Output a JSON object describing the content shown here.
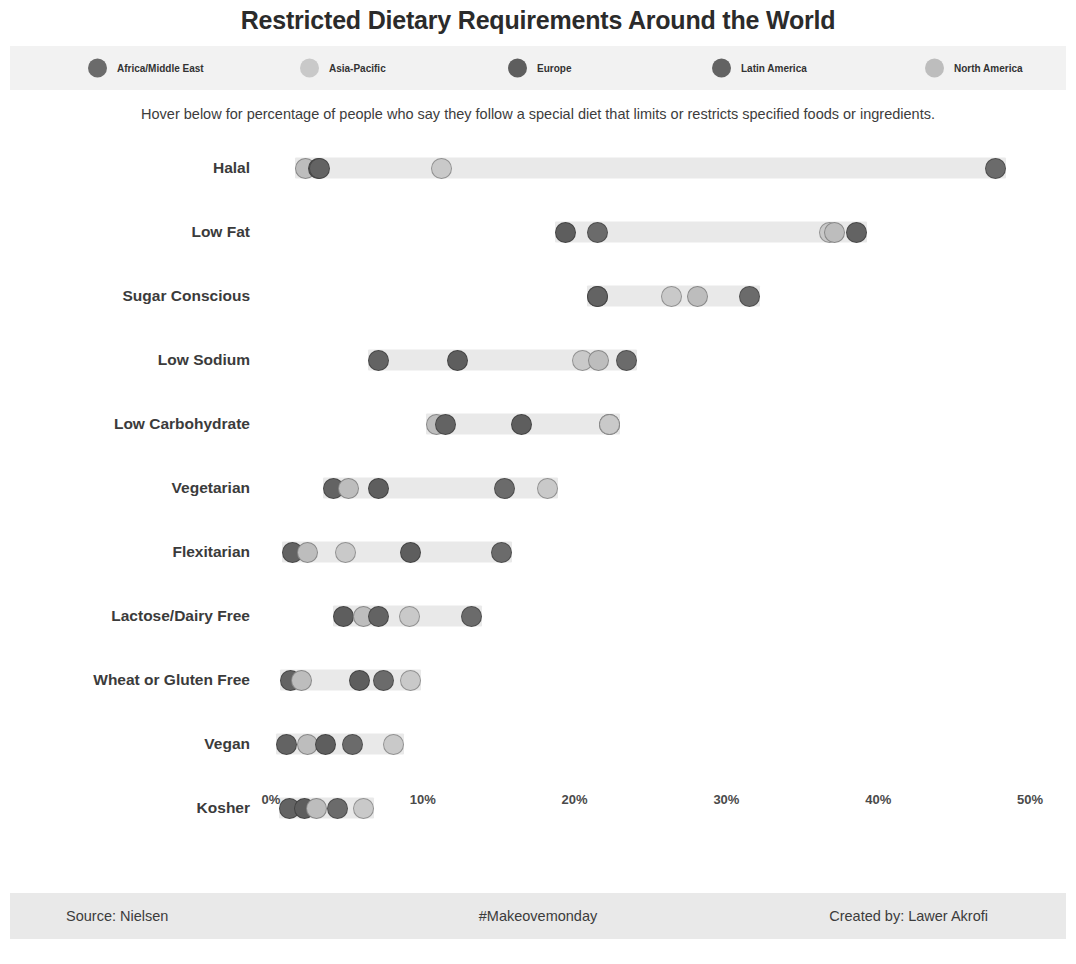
{
  "header": {
    "title": "Restricted Dietary Requirements Around the World",
    "subtitle": "Hover below for percentage of people who say they follow a special diet that limits or restricts specified foods or ingredients."
  },
  "footer": {
    "source": "Source: Nielsen",
    "hashtag": "#Makeovemonday",
    "credit": "Created by: Lawer Akrofi"
  },
  "chart_data": {
    "type": "scatter",
    "title": "Restricted Dietary Requirements Around the World",
    "subtitle": "Hover below for percentage of people who say they follow a special diet that limits or restricts specified foods or ingredients.",
    "xlabel": "",
    "ylabel": "",
    "xlim": [
      0,
      50
    ],
    "xtick_values": [
      0,
      10,
      20,
      30,
      40,
      50
    ],
    "xtick_labels": [
      "0%",
      "10%",
      "20%",
      "30%",
      "40%",
      "50%"
    ],
    "grid": false,
    "legend_position": "top",
    "dot_radius_px": 10.5,
    "track_color": "#e9e9e9",
    "legend": [
      {
        "name": "Africa/Middle East",
        "color": "#6b6b6b"
      },
      {
        "name": "Asia-Pacific",
        "color": "#c9c9c9"
      },
      {
        "name": "Europe",
        "color": "#5e5e5e"
      },
      {
        "name": "Latin America",
        "color": "#636363"
      },
      {
        "name": "North America",
        "color": "#bdbdbd"
      }
    ],
    "categories": [
      "Halal",
      "Low Fat",
      "Sugar Conscious",
      "Low Sodium",
      "Low Carbohydrate",
      "Vegetarian",
      "Flexitarian",
      "Lactose/Dairy Free",
      "Wheat or Gluten Free",
      "Vegan",
      "Kosher"
    ],
    "series": [
      {
        "name": "Africa/Middle East",
        "color": "#6b6b6b",
        "values": [
          47.7,
          21.5,
          31.5,
          23.4,
          22.3,
          15.4,
          15.2,
          13.2,
          7.4,
          5.4,
          4.4
        ]
      },
      {
        "name": "Asia-Pacific",
        "color": "#c9c9c9",
        "values": [
          11.2,
          36.8,
          26.4,
          20.5,
          22.3,
          18.2,
          4.9,
          9.1,
          9.2,
          8.1,
          6.1
        ]
      },
      {
        "name": "Europe",
        "color": "#5e5e5e",
        "values": [
          3.1,
          19.4,
          21.5,
          12.3,
          16.5,
          7.1,
          9.2,
          4.8,
          5.8,
          3.6,
          2.2
        ]
      },
      {
        "name": "Latin America",
        "color": "#636363",
        "values": [
          3.2,
          38.6,
          21.5,
          7.1,
          11.5,
          4.1,
          1.4,
          7.1,
          1.3,
          1.0,
          1.2
        ]
      },
      {
        "name": "North America",
        "color": "#bdbdbd",
        "values": [
          2.3,
          37.1,
          28.1,
          21.6,
          10.9,
          5.1,
          2.4,
          6.1,
          2.0,
          2.4,
          3.0
        ]
      }
    ]
  }
}
